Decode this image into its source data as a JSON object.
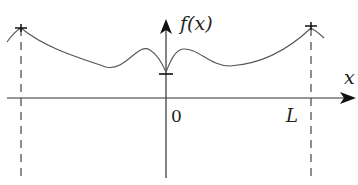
{
  "diagram": {
    "y_axis_label": "f(x)",
    "x_axis_label": "x",
    "origin_label": "0",
    "period_label": "L",
    "colors": {
      "line": "#333333",
      "curve": "#555555",
      "background": "#ffffff"
    }
  }
}
